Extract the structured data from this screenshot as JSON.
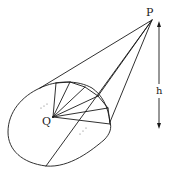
{
  "diagram": {
    "type": "cone-with-inscribed-polygon",
    "labels": {
      "apex": "P",
      "base_center": "Q",
      "height": "h"
    },
    "colors": {
      "stroke": "#1a1a1a",
      "background": "#ffffff"
    },
    "points": {
      "P": [
        152,
        20
      ],
      "Q": [
        53,
        117
      ]
    }
  }
}
